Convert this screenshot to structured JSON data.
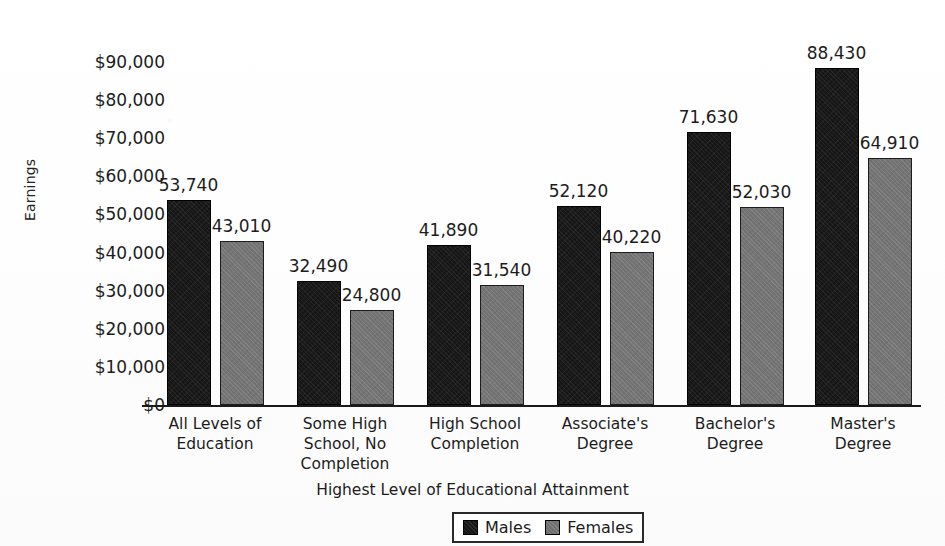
{
  "chart_data": {
    "type": "bar",
    "title": "",
    "xlabel": "Highest Level of Educational Attainment",
    "ylabel": "Earnings",
    "ylim": [
      0,
      95000
    ],
    "ytick_values": [
      0,
      10000,
      20000,
      30000,
      40000,
      50000,
      60000,
      70000,
      80000,
      90000
    ],
    "ytick_labels": [
      "$0",
      "$10,000",
      "$20,000",
      "$30,000",
      "$40,000",
      "$50,000",
      "$60,000",
      "$70,000",
      "$80,000",
      "$90,000"
    ],
    "grid": false,
    "legend_position": "bottom-center",
    "categories": [
      "All Levels of\nEducation",
      "Some High\nSchool, No\nCompletion",
      "High School\nCompletion",
      "Associate's\nDegree",
      "Bachelor's\nDegree",
      "Master's Degree"
    ],
    "series": [
      {
        "name": "Males",
        "color": "#161616",
        "values": [
          53740,
          32490,
          41890,
          52120,
          71630,
          88430
        ],
        "data_labels": [
          "53,740",
          "32,490",
          "41,890",
          "52,120",
          "71,630",
          "88,430"
        ]
      },
      {
        "name": "Females",
        "color": "#747474",
        "values": [
          43010,
          24800,
          31540,
          40220,
          52030,
          64910
        ],
        "data_labels": [
          "43,010",
          "24,800",
          "31,540",
          "40,220",
          "52,030",
          "64,910"
        ]
      }
    ]
  },
  "legend": {
    "entries": [
      {
        "label": "Males",
        "swatch": "male"
      },
      {
        "label": "Females",
        "swatch": "female"
      }
    ]
  }
}
